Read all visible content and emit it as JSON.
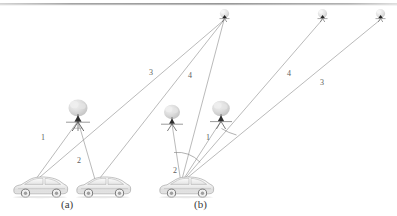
{
  "figure": {
    "background_color": "#ffffff",
    "line_color": "#8c8c8c",
    "label_color": "#5d5d5d",
    "caption_color": "#3a3a3a",
    "top_rule": {
      "name": "top-divider-rule",
      "color": "#9a9a9a",
      "y": 4
    }
  },
  "captions": [
    {
      "text": "(a)",
      "x": 61,
      "y": 199
    },
    {
      "text": "(b)",
      "x": 194,
      "y": 199
    }
  ],
  "path_labels": [
    {
      "text": "1",
      "x": 41,
      "y": 134,
      "group": "a",
      "desc": "direct-path-a"
    },
    {
      "text": "2",
      "x": 77,
      "y": 157,
      "group": "a",
      "desc": "reflected-path-a"
    },
    {
      "text": "3",
      "x": 149,
      "y": 69,
      "group": "a",
      "desc": "satellite-path-3-a"
    },
    {
      "text": "4",
      "x": 188,
      "y": 72,
      "group": "a",
      "desc": "satellite-path-4-a"
    },
    {
      "text": "1",
      "x": 206,
      "y": 134,
      "group": "b",
      "desc": "direct-path-b"
    },
    {
      "text": "2",
      "x": 173,
      "y": 167,
      "group": "b",
      "desc": "reflected-path-b"
    },
    {
      "text": "4",
      "x": 287,
      "y": 70,
      "group": "b",
      "desc": "satellite-path-4-b"
    },
    {
      "text": "3",
      "x": 320,
      "y": 79,
      "group": "b",
      "desc": "satellite-path-3-b"
    }
  ],
  "scene": {
    "cars": [
      {
        "name": "car-a-left",
        "x": 12,
        "y": 176,
        "w": 56,
        "h": 22
      },
      {
        "name": "car-a-right",
        "x": 75,
        "y": 176,
        "w": 56,
        "h": 22
      },
      {
        "name": "car-b",
        "x": 158,
        "y": 176,
        "w": 56,
        "h": 22
      }
    ],
    "base_stations": [
      {
        "name": "base-station-a",
        "x": 67,
        "y": 103,
        "w": 22,
        "h": 26
      },
      {
        "name": "base-station-b1",
        "x": 164,
        "y": 106,
        "w": 18,
        "h": 22
      },
      {
        "name": "base-station-b2",
        "x": 212,
        "y": 103,
        "w": 20,
        "h": 24
      }
    ],
    "satellites": [
      {
        "name": "satellite-1",
        "x": 224,
        "y": 16
      },
      {
        "name": "satellite-2",
        "x": 322,
        "y": 16
      },
      {
        "name": "satellite-3",
        "x": 380,
        "y": 16
      }
    ],
    "angle_arcs": [
      {
        "name": "angle-arc-b-large"
      },
      {
        "name": "angle-arc-b-small"
      }
    ]
  }
}
